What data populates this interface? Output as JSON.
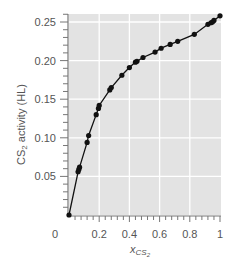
{
  "chart_data": {
    "type": "scatter",
    "title": "",
    "xlabel": "x_CS2",
    "xlabel_main": "x",
    "xlabel_sub": "CS",
    "xlabel_subsub": "2",
    "ylabel": "CS2 activity (HL)",
    "ylabel_pre": "CS",
    "ylabel_sub": "2",
    "ylabel_post": " activity (HL)",
    "xlim": [
      0,
      1
    ],
    "ylim": [
      0,
      0.26
    ],
    "x_ticks": [
      0.2,
      0.4,
      0.6,
      0.8,
      1
    ],
    "x_tick_labels": [
      "0.2",
      "0.4",
      "0.6",
      "0.8",
      "1"
    ],
    "y_ticks": [
      0.05,
      0.1,
      0.15,
      0.2,
      0.25
    ],
    "y_tick_labels": [
      "0.05",
      "0.10",
      "0.15",
      "0.20",
      "0.25"
    ],
    "origin_label": "0",
    "grid": true,
    "background": "#e3e3e3",
    "marker_color": "#111111",
    "line_color": "#111111",
    "series": [
      {
        "name": "CS2 activity",
        "x": [
          0.0,
          0.06,
          0.065,
          0.07,
          0.12,
          0.13,
          0.18,
          0.195,
          0.2,
          0.27,
          0.28,
          0.35,
          0.4,
          0.44,
          0.45,
          0.49,
          0.57,
          0.61,
          0.67,
          0.72,
          0.83,
          0.92,
          0.94,
          0.95,
          0.96,
          1.0
        ],
        "y": [
          0.0,
          0.056,
          0.059,
          0.062,
          0.094,
          0.103,
          0.13,
          0.138,
          0.142,
          0.162,
          0.165,
          0.181,
          0.191,
          0.198,
          0.199,
          0.204,
          0.211,
          0.216,
          0.221,
          0.225,
          0.234,
          0.247,
          0.249,
          0.25,
          0.252,
          0.258
        ]
      }
    ]
  }
}
